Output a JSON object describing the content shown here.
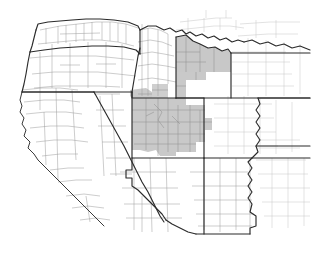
{
  "map": {
    "title": "Western United States County Map",
    "type": "choropleth-region-map",
    "width": 317,
    "height": 271,
    "background_color": "#ffffff",
    "colors": {
      "background": "#ffffff",
      "highlight_fill": "#c8c8c8",
      "highlight_fill_light": "#d4d4d4",
      "state_border": "#2b2b2b",
      "county_border": "#9a9a9a",
      "county_border_faint": "#c4c4c4",
      "coastline": "#3a3a3a"
    },
    "legend": {
      "visible": false,
      "highlight_meaning": "shaded counties"
    },
    "labels": [],
    "states": [
      {
        "code": "WA",
        "name": "Washington",
        "highlighted": false
      },
      {
        "code": "OR",
        "name": "Oregon",
        "highlighted": false
      },
      {
        "code": "ID",
        "name": "Idaho",
        "highlighted": false
      },
      {
        "code": "MT",
        "name": "Montana",
        "highlighted": false
      },
      {
        "code": "CA",
        "name": "California",
        "highlighted": false
      },
      {
        "code": "NV",
        "name": "Nevada",
        "highlighted": false
      },
      {
        "code": "UT",
        "name": "Utah",
        "highlighted": true
      },
      {
        "code": "WY",
        "name": "Wyoming",
        "highlighted": true
      },
      {
        "code": "CO",
        "name": "Colorado",
        "highlighted": true
      },
      {
        "code": "AZ",
        "name": "Arizona",
        "highlighted": false
      },
      {
        "code": "NM",
        "name": "New Mexico",
        "highlighted": false
      },
      {
        "code": "NE",
        "name": "Nebraska",
        "highlighted": false
      },
      {
        "code": "KS",
        "name": "Kansas",
        "highlighted": false
      },
      {
        "code": "OK",
        "name": "Oklahoma",
        "highlighted": false
      },
      {
        "code": "TX",
        "name": "Texas",
        "highlighted": false
      },
      {
        "code": "ND",
        "name": "North Dakota",
        "highlighted": false
      },
      {
        "code": "SD",
        "name": "South Dakota",
        "highlighted": false
      }
    ],
    "highlighted_region": {
      "description": "Contiguous shaded counties spanning western Wyoming, eastern Utah and western Colorado",
      "fill_color": "#c8c8c8"
    }
  }
}
